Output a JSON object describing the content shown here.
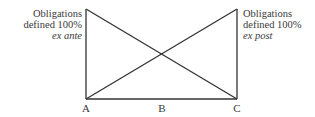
{
  "diagram": {
    "left_label": {
      "line1": "Obligations",
      "line2": "defined 100%",
      "line3": "ex ante"
    },
    "right_label": {
      "line1": "Obligations",
      "line2": "defined 100%",
      "line3": "ex post"
    },
    "points": {
      "a": "A",
      "b": "B",
      "c": "C"
    },
    "line_color": "#333333"
  }
}
